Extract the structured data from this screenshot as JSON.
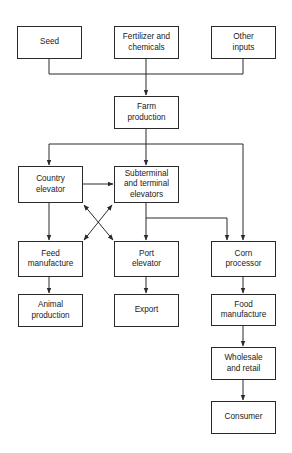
{
  "diagram": {
    "type": "flowchart",
    "nodes": {
      "seed": "Seed",
      "fertilizer": "Fertilizer and\nchemicals",
      "other_inputs": "Other\ninputs",
      "farm": "Farm\nproduction",
      "country_elevator": "Country\nelevator",
      "subterminal": "Subterminal\nand terminal\nelevators",
      "feed": "Feed\nmanufacture",
      "port": "Port\nelevator",
      "corn": "Corn\nprocessor",
      "animal": "Animal\nproduction",
      "export": "Export",
      "food": "Food\nmanufacture",
      "wholesale": "Wholesale\nand  retail",
      "consumer": "Consumer"
    },
    "edges": [
      [
        "Seed",
        "Farm production"
      ],
      [
        "Fertilizer and chemicals",
        "Farm production"
      ],
      [
        "Other inputs",
        "Farm production"
      ],
      [
        "Farm production",
        "Country elevator"
      ],
      [
        "Farm production",
        "Subterminal and terminal elevators"
      ],
      [
        "Farm production",
        "Corn processor"
      ],
      [
        "Country elevator",
        "Subterminal and terminal elevators"
      ],
      [
        "Country elevator",
        "Feed manufacture"
      ],
      [
        "Country elevator",
        "Port elevator",
        "bidirectional"
      ],
      [
        "Subterminal and terminal elevators",
        "Feed manufacture",
        "bidirectional"
      ],
      [
        "Subterminal and terminal elevators",
        "Port elevator"
      ],
      [
        "Subterminal and terminal elevators",
        "Corn processor"
      ],
      [
        "Feed manufacture",
        "Animal production"
      ],
      [
        "Port elevator",
        "Export"
      ],
      [
        "Corn processor",
        "Food manufacture"
      ],
      [
        "Food manufacture",
        "Wholesale and retail"
      ],
      [
        "Wholesale and retail",
        "Consumer"
      ]
    ],
    "line_color": "#2a2a2a"
  }
}
